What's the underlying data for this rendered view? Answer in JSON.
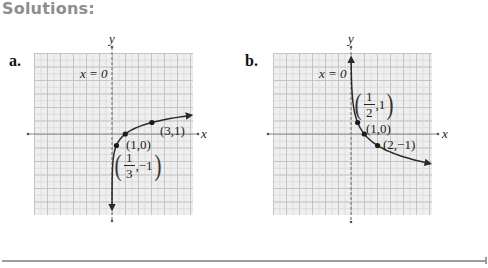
{
  "header": {
    "title": "Solutions:"
  },
  "parts": [
    {
      "label": "a."
    },
    {
      "label": "b."
    }
  ],
  "colors": {
    "title": "#8e8e8e",
    "axis": "#8a8a8a",
    "curve": "#2a2a2a",
    "grid_bg": "#efefef",
    "grid_major": "#c4c4c4",
    "grid_minor": "#dcdcdc"
  },
  "chart_data": [
    {
      "type": "line",
      "panel": "a",
      "function": "y = log_3(x)",
      "base": 3,
      "y_range": [
        -6.6,
        1.63
      ],
      "xlabel": "x",
      "ylabel": "y",
      "grid": true,
      "xlim": [
        -6,
        6
      ],
      "ylim": [
        -6,
        6
      ],
      "asymptote": {
        "label": "x = 0",
        "x": 0
      },
      "points": [
        {
          "x": 0.3333,
          "y": -1,
          "label_num": "1",
          "label_den": "3",
          "label_rest": ",−1",
          "fraction": true
        },
        {
          "x": 1,
          "y": 0,
          "label": "(1,0)"
        },
        {
          "x": 3,
          "y": 1,
          "label": "(3,1)"
        }
      ]
    },
    {
      "type": "line",
      "panel": "b",
      "function": "y = log_(1/2)(x)",
      "base": 0.5,
      "y_range": [
        6.7,
        -2.58
      ],
      "xlabel": "x",
      "ylabel": "y",
      "grid": true,
      "xlim": [
        -6,
        6
      ],
      "ylim": [
        -6,
        6
      ],
      "asymptote": {
        "label": "x = 0",
        "x": 0
      },
      "points": [
        {
          "x": 0.5,
          "y": 1,
          "label_num": "1",
          "label_den": "2",
          "label_rest": ",1",
          "fraction": true
        },
        {
          "x": 1,
          "y": 0,
          "label": "(1,0)"
        },
        {
          "x": 2,
          "y": -1,
          "label": "(2,−1)"
        }
      ]
    }
  ]
}
